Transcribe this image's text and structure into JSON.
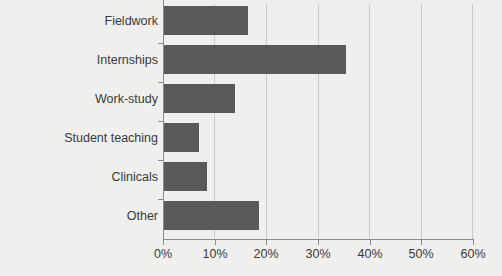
{
  "chart_data": {
    "type": "bar",
    "orientation": "horizontal",
    "title": "",
    "xlabel": "",
    "ylabel": "",
    "xlim": [
      0,
      60
    ],
    "xtick_labels": [
      "0%",
      "10%",
      "20%",
      "30%",
      "40%",
      "50%",
      "60%"
    ],
    "xtick_values": [
      0,
      10,
      20,
      30,
      40,
      50,
      60
    ],
    "grid": true,
    "legend": false,
    "categories": [
      "Fieldwork",
      "Internships",
      "Work-study",
      "Student teaching",
      "Clinicals",
      "Other"
    ],
    "values": [
      16.5,
      35.5,
      14.0,
      7.0,
      8.5,
      18.5
    ],
    "value_labels": [
      "16.5%",
      "35.5%",
      "14%",
      "7%",
      "8.5%",
      "18.5%"
    ],
    "colors": {
      "bar_fill": "#595959",
      "background": "#efefed",
      "gridline": "#c9c9c7",
      "axis": "#8c8c8a",
      "text": "#3a3a3a"
    }
  }
}
